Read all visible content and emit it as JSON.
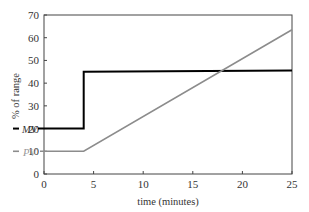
{
  "chart_data": {
    "type": "line",
    "title": "",
    "xlabel": "time (minutes)",
    "ylabel": "% of range",
    "xlim": [
      0,
      25
    ],
    "ylim": [
      0,
      70
    ],
    "xticks": [
      0,
      5,
      10,
      15,
      20,
      25
    ],
    "yticks": [
      0,
      10,
      20,
      30,
      40,
      50,
      60,
      70
    ],
    "grid": false,
    "legend": "inline labels at left",
    "series": [
      {
        "name": "MV",
        "color": "#000000",
        "x": [
          0,
          4,
          4,
          25
        ],
        "y": [
          20,
          20,
          45,
          45.5
        ]
      },
      {
        "name": "PV",
        "color": "#8c8c8c",
        "x": [
          0,
          4,
          25
        ],
        "y": [
          10,
          10,
          63.5
        ]
      }
    ]
  },
  "labels": {
    "mv": "MV",
    "pv": "PV",
    "xlabel": "time (minutes)",
    "ylabel": "% of range"
  }
}
